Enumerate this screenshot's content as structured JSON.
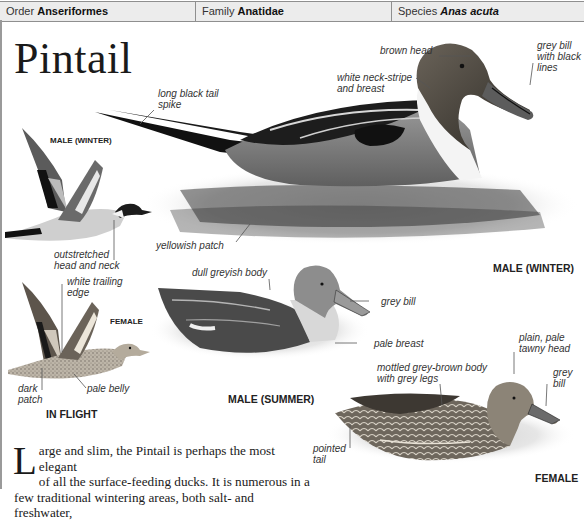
{
  "header": {
    "order_label": "Order",
    "order_value": "Anseriformes",
    "family_label": "Family",
    "family_value": "Anatidae",
    "species_label": "Species",
    "species_value": "Anas acuta"
  },
  "title": "Pintail",
  "illustrations": {
    "male_winter": {
      "caption": "MALE (WINTER)",
      "labels": {
        "brown_head": "brown head",
        "grey_bill_1": "grey bill",
        "grey_bill_2": "with black",
        "grey_bill_3": "lines",
        "neck_stripe_1": "white neck-stripe",
        "neck_stripe_2": "and breast",
        "tail_spike_1": "long black tail",
        "tail_spike_2": "spike",
        "yellowish_patch": "yellowish patch"
      }
    },
    "in_flight": {
      "caption": "IN FLIGHT",
      "male_caption": "MALE (WINTER)",
      "female_caption": "FEMALE",
      "labels": {
        "outstretched_1": "outstretched",
        "outstretched_2": "head and neck",
        "trailing_1": "white trailing",
        "trailing_2": "edge",
        "dark_patch_1": "dark",
        "dark_patch_2": "patch",
        "pale_belly": "pale belly"
      }
    },
    "male_summer": {
      "caption": "MALE (SUMMER)",
      "labels": {
        "dull_body": "dull greyish body",
        "grey_bill": "grey bill",
        "pale_breast": "pale breast"
      }
    },
    "female": {
      "caption": "FEMALE",
      "labels": {
        "mottled_1": "mottled grey-brown body",
        "mottled_2": "with grey legs",
        "head_1": "plain, pale",
        "head_2": "tawny head",
        "bill_1": "grey",
        "bill_2": "bill",
        "tail_1": "pointed",
        "tail_2": "tail"
      }
    }
  },
  "body_text": {
    "dropcap": "L",
    "line1": "arge and slim, the Pintail is perhaps the most elegant",
    "line2": "of all the surface-feeding ducks. It is numerous in a",
    "line3": "few traditional wintering areas, both salt- and freshwater,"
  },
  "colors": {
    "header_bg": "#ececec",
    "rule": "#8f8f8f",
    "text": "#1a1a1a"
  }
}
